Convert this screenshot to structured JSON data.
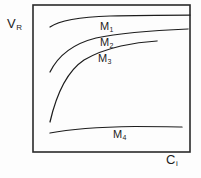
{
  "figure": {
    "background_color": "#fdfdfd",
    "line_color": "#1d1d1d",
    "text_color": "#1d1d1d"
  },
  "axes": {
    "y": {
      "symbol": "V",
      "subscript": "R",
      "full": "V_R",
      "position": "top-left-outside"
    },
    "x": {
      "symbol": "C",
      "subscript": "i",
      "full": "C_i",
      "position": "bottom-right-outside"
    },
    "frame": {
      "left": 33,
      "top": 5,
      "right": 190,
      "bottom": 152
    },
    "ticks": [],
    "gridlines": false
  },
  "curve_labels": [
    {
      "symbol": "M",
      "subscript": "1",
      "full": "M_1"
    },
    {
      "symbol": "M",
      "subscript": "2",
      "full": "M_2"
    },
    {
      "symbol": "M",
      "subscript": "3",
      "full": "M_3"
    },
    {
      "symbol": "M",
      "subscript": "4",
      "full": "M_4"
    }
  ],
  "chart_data": {
    "type": "line",
    "title": "",
    "subtitle": "",
    "xlabel": "C_i",
    "ylabel": "V_R",
    "xlim": [
      0,
      1
    ],
    "ylim": [
      0,
      1
    ],
    "grid": false,
    "axis_ticks": false,
    "legend": "inline-curve-labels",
    "note": "Schematic hand-drawn plot: four monotonically increasing saturating curves, no numeric tick values shown.",
    "series": [
      {
        "name": "M_1",
        "label": "M_1",
        "color": "#1d1d1d",
        "x": [
          0.11,
          0.2,
          0.32,
          0.48,
          0.66,
          0.84,
          1.0
        ],
        "y": [
          0.85,
          0.89,
          0.91,
          0.92,
          0.93,
          0.935,
          0.94
        ],
        "path": "M 50,27 C 60,20 80,17 110,16 C 140,15 170,15 190,15"
      },
      {
        "name": "M_2",
        "label": "M_2",
        "color": "#1d1d1d",
        "x": [
          0.11,
          0.2,
          0.32,
          0.48,
          0.66,
          0.84,
          0.99
        ],
        "y": [
          0.54,
          0.7,
          0.78,
          0.81,
          0.83,
          0.84,
          0.85
        ],
        "path": "M 50,72 C 58,56 72,44 96,38 C 125,32 165,30 188,29"
      },
      {
        "name": "M_3",
        "label": "M_3",
        "color": "#1d1d1d",
        "x": [
          0.11,
          0.16,
          0.24,
          0.38,
          0.55,
          0.7,
          0.79
        ],
        "y": [
          0.2,
          0.42,
          0.6,
          0.7,
          0.73,
          0.745,
          0.75
        ],
        "path": "M 50,122 C 56,96 66,72 84,60 C 106,47 136,42 157,41"
      },
      {
        "name": "M_4",
        "label": "M_4",
        "color": "#1d1d1d",
        "x": [
          0.11,
          0.25,
          0.45,
          0.68,
          0.95
        ],
        "y": [
          0.13,
          0.15,
          0.16,
          0.165,
          0.17
        ],
        "path": "M 50,133 C 70,129 100,127 135,126.5 C 160,126.5 175,126.5 182,127"
      }
    ]
  }
}
